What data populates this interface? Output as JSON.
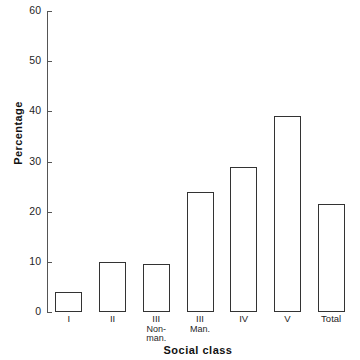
{
  "chart_data": {
    "type": "bar",
    "title": "",
    "subtitle": "",
    "xlabel": "Social class",
    "ylabel": "Percentage",
    "categories": [
      "I",
      "II",
      "III Non-man.",
      "III Man.",
      "IV",
      "V",
      "Total"
    ],
    "category_labels": [
      {
        "main": "I",
        "sub1": "",
        "sub2": ""
      },
      {
        "main": "II",
        "sub1": "",
        "sub2": ""
      },
      {
        "main": "III",
        "sub1": "Non-",
        "sub2": "man."
      },
      {
        "main": "III",
        "sub1": "Man.",
        "sub2": ""
      },
      {
        "main": "IV",
        "sub1": "",
        "sub2": ""
      },
      {
        "main": "V",
        "sub1": "",
        "sub2": ""
      },
      {
        "main": "Total",
        "sub1": "",
        "sub2": ""
      }
    ],
    "values": [
      4,
      10,
      9.5,
      24,
      29,
      39,
      21.5
    ],
    "ylim": [
      0,
      60
    ],
    "ytick_values": [
      0,
      10,
      20,
      30,
      40,
      50,
      60
    ],
    "ytick_labels": [
      "0",
      "10",
      "20",
      "30",
      "40",
      "50",
      "60"
    ],
    "grid": false,
    "legend": false,
    "legend_position": "none",
    "bar_fill_color": "#ffffff",
    "bar_edge_color": "#333333",
    "axis_color": "#555555",
    "background_color": "#ffffff"
  }
}
